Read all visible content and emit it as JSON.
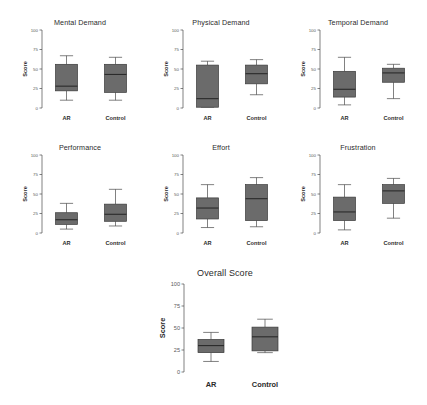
{
  "figure": {
    "ylabel": "Score",
    "categories": [
      "AR",
      "Control"
    ],
    "yticks": [
      "100",
      "75",
      "50",
      "25",
      "0"
    ],
    "ytick_values": [
      100,
      75,
      50,
      25,
      0
    ],
    "ylim": [
      0,
      100
    ],
    "box_fill": "#6b6b6b",
    "box_stroke": "#3a3a3a",
    "median_color": "#2a2a2a"
  },
  "panels": [
    {
      "title": "Mental Demand",
      "chart_data": {
        "type": "box",
        "title": "Mental Demand",
        "xlabel": "",
        "ylabel": "Score",
        "ylim": [
          0,
          100
        ],
        "categories": [
          "AR",
          "Control"
        ],
        "boxes": [
          {
            "name": "AR",
            "min": 10,
            "q1": 22,
            "median": 28,
            "q3": 56,
            "max": 67
          },
          {
            "name": "Control",
            "min": 10,
            "q1": 20,
            "median": 43,
            "q3": 56,
            "max": 65
          }
        ]
      }
    },
    {
      "title": "Physical Demand",
      "chart_data": {
        "type": "box",
        "title": "Physical Demand",
        "xlabel": "",
        "ylabel": "Score",
        "ylim": [
          0,
          100
        ],
        "categories": [
          "AR",
          "Control"
        ],
        "boxes": [
          {
            "name": "AR",
            "min": 1,
            "q1": 1,
            "median": 12,
            "q3": 55,
            "max": 60
          },
          {
            "name": "Control",
            "min": 17,
            "q1": 31,
            "median": 44,
            "q3": 55,
            "max": 62
          }
        ]
      }
    },
    {
      "title": "Temporal Demand",
      "chart_data": {
        "type": "box",
        "title": "Temporal Demand",
        "xlabel": "",
        "ylabel": "Score",
        "ylim": [
          0,
          100
        ],
        "categories": [
          "AR",
          "Control"
        ],
        "boxes": [
          {
            "name": "AR",
            "min": 4,
            "q1": 14,
            "median": 24,
            "q3": 47,
            "max": 65
          },
          {
            "name": "Control",
            "min": 12,
            "q1": 33,
            "median": 45,
            "q3": 51,
            "max": 56
          }
        ]
      }
    },
    {
      "title": "Performance",
      "chart_data": {
        "type": "box",
        "title": "Performance",
        "xlabel": "",
        "ylabel": "Score",
        "ylim": [
          0,
          100
        ],
        "categories": [
          "AR",
          "Control"
        ],
        "boxes": [
          {
            "name": "AR",
            "min": 5,
            "q1": 11,
            "median": 17,
            "q3": 26,
            "max": 38
          },
          {
            "name": "Control",
            "min": 9,
            "q1": 15,
            "median": 24,
            "q3": 37,
            "max": 56
          }
        ]
      }
    },
    {
      "title": "Effort",
      "chart_data": {
        "type": "box",
        "title": "Effort",
        "xlabel": "",
        "ylabel": "Score",
        "ylim": [
          0,
          100
        ],
        "categories": [
          "AR",
          "Control"
        ],
        "boxes": [
          {
            "name": "AR",
            "min": 7,
            "q1": 18,
            "median": 32,
            "q3": 45,
            "max": 62
          },
          {
            "name": "Control",
            "min": 8,
            "q1": 16,
            "median": 44,
            "q3": 62,
            "max": 71
          }
        ]
      }
    },
    {
      "title": "Frustration",
      "chart_data": {
        "type": "box",
        "title": "Frustration",
        "xlabel": "",
        "ylabel": "Score",
        "ylim": [
          0,
          100
        ],
        "categories": [
          "AR",
          "Control"
        ],
        "boxes": [
          {
            "name": "AR",
            "min": 4,
            "q1": 16,
            "median": 27,
            "q3": 46,
            "max": 62
          },
          {
            "name": "Control",
            "min": 19,
            "q1": 38,
            "median": 54,
            "q3": 62,
            "max": 70
          }
        ]
      }
    },
    {
      "title": "Overall Score",
      "chart_data": {
        "type": "box",
        "title": "Overall Score",
        "xlabel": "",
        "ylabel": "Score",
        "ylim": [
          0,
          100
        ],
        "categories": [
          "AR",
          "Control"
        ],
        "boxes": [
          {
            "name": "AR",
            "min": 12,
            "q1": 22,
            "median": 30,
            "q3": 37,
            "max": 45
          },
          {
            "name": "Control",
            "min": 22,
            "q1": 24,
            "median": 40,
            "q3": 51,
            "max": 60
          }
        ]
      }
    }
  ]
}
